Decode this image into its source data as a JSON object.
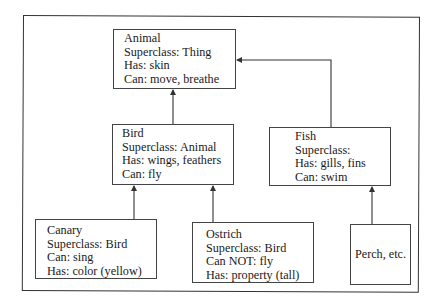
{
  "diagram": {
    "type": "class-hierarchy",
    "nodes": {
      "animal": {
        "name": "Animal",
        "lines": [
          "Animal",
          "Superclass: Thing",
          "Has: skin",
          "Can: move, breathe"
        ]
      },
      "bird": {
        "name": "Bird",
        "lines": [
          "Bird",
          "Superclass: Animal",
          "Has: wings, feathers",
          "Can: fly"
        ]
      },
      "fish": {
        "name": "Fish",
        "lines": [
          "Fish",
          "Superclass:",
          "Has: gills, fins",
          "Can: swim"
        ]
      },
      "canary": {
        "name": "Canary",
        "lines": [
          "Canary",
          "Superclass: Bird",
          "Can: sing",
          "Has: color (yellow)"
        ]
      },
      "ostrich": {
        "name": "Ostrich",
        "lines": [
          "Ostrich",
          "Superclass: Bird",
          "Can NOT: fly",
          "Has: property (tall)"
        ]
      },
      "perch": {
        "name": "Perch, etc.",
        "lines": [
          "Perch, etc."
        ]
      }
    },
    "edges": [
      {
        "from": "bird",
        "to": "animal"
      },
      {
        "from": "fish",
        "to": "animal"
      },
      {
        "from": "canary",
        "to": "bird"
      },
      {
        "from": "ostrich",
        "to": "bird"
      },
      {
        "from": "perch",
        "to": "fish"
      }
    ],
    "colors": {
      "line": "#333333",
      "background": "#ffffff",
      "text": "#1a1a1a"
    }
  }
}
